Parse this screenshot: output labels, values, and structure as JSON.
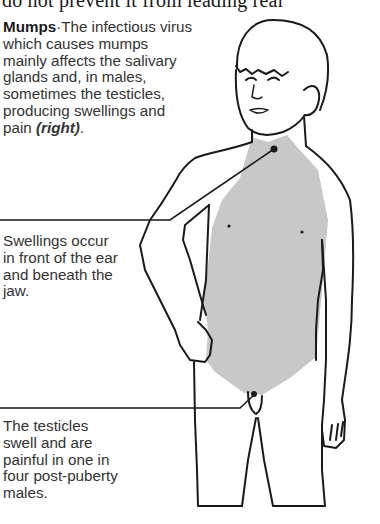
{
  "page": {
    "top_line_text": "do not prevent it from leading real"
  },
  "captions": {
    "main": {
      "title": "Mumps",
      "separator": "·",
      "body": "The infectious virus which causes mumps mainly affects the salivary glands and, in males, sometimes the testicles, producing swellings and pain ",
      "reference": "(right)",
      "end": "."
    },
    "jaw": {
      "text": "Swellings occur in front of the ear and beneath the jaw."
    },
    "testicles": {
      "text": "The testicles swell and are painful in one in four post-puberty males."
    }
  },
  "illustration": {
    "subject": "boy-figure",
    "highlight_color": "#c8c8c8",
    "line_color": "#1a1a1a"
  }
}
